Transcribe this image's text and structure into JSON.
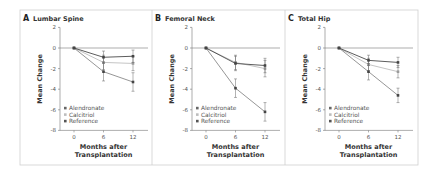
{
  "figure": {
    "panels": [
      {
        "letter": "A",
        "title": "Lumbar Spine"
      },
      {
        "letter": "B",
        "title": "Femoral Neck"
      },
      {
        "letter": "C",
        "title": "Total Hip"
      }
    ],
    "ylabel": "Mean Change",
    "xlabel_line1": "Months after",
    "xlabel_line2": "Transplantation",
    "yticks": [
      "2",
      "0",
      "-2",
      "-4",
      "-6",
      "-8"
    ],
    "xticks": [
      "0",
      "6",
      "12"
    ],
    "legend": [
      "Alendronate",
      "Calcitriol",
      "Reference"
    ],
    "colors": {
      "Alendronate": "#4a4a4a",
      "Calcitriol": "#bdbdbd",
      "Reference": "#8a8a8a",
      "frame": "#cfcfcf"
    }
  },
  "chart_data": [
    {
      "type": "line",
      "title": "A Lumbar Spine",
      "xlabel": "Months after Transplantation",
      "ylabel": "Mean Change",
      "x": [
        0,
        6,
        12
      ],
      "ylim": [
        -8,
        2
      ],
      "series": [
        {
          "name": "Alendronate",
          "values": [
            0,
            -0.9,
            -0.8
          ],
          "error": [
            0,
            0.6,
            0.6
          ]
        },
        {
          "name": "Calcitriol",
          "values": [
            0,
            -1.4,
            -1.5
          ],
          "error": [
            0,
            0.7,
            0.7
          ]
        },
        {
          "name": "Reference",
          "values": [
            0,
            -2.3,
            -3.3
          ],
          "error": [
            0,
            0.9,
            0.9
          ]
        }
      ],
      "legend_position": "lower left"
    },
    {
      "type": "line",
      "title": "B Femoral Neck",
      "xlabel": "Months after Transplantation",
      "ylabel": "Mean Change",
      "x": [
        0,
        6,
        12
      ],
      "ylim": [
        -8,
        2
      ],
      "series": [
        {
          "name": "Alendronate",
          "values": [
            0,
            -1.5,
            -1.7
          ],
          "error": [
            0,
            0.7,
            0.7
          ]
        },
        {
          "name": "Calcitriol",
          "values": [
            0,
            -1.4,
            -2.0
          ],
          "error": [
            0,
            0.7,
            0.8
          ]
        },
        {
          "name": "Reference",
          "values": [
            0,
            -3.9,
            -6.2
          ],
          "error": [
            0,
            0.9,
            0.9
          ]
        }
      ],
      "legend_position": "lower left"
    },
    {
      "type": "line",
      "title": "C Total Hip",
      "xlabel": "Months after Transplantation",
      "ylabel": "Mean Change",
      "x": [
        0,
        6,
        12
      ],
      "ylim": [
        -8,
        2
      ],
      "series": [
        {
          "name": "Alendronate",
          "values": [
            0,
            -1.2,
            -1.4
          ],
          "error": [
            0,
            0.5,
            0.5
          ]
        },
        {
          "name": "Calcitriol",
          "values": [
            0,
            -1.6,
            -2.3
          ],
          "error": [
            0,
            0.6,
            0.6
          ]
        },
        {
          "name": "Reference",
          "values": [
            0,
            -2.3,
            -4.6
          ],
          "error": [
            0,
            0.8,
            0.7
          ]
        }
      ],
      "legend_position": "lower left"
    }
  ]
}
